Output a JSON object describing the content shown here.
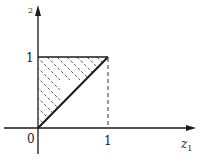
{
  "diagram": {
    "axes": {
      "x_label": "z",
      "x_label_sub": "1",
      "y_label": "2",
      "origin_label": "0",
      "x_tick_label": "1",
      "y_tick_label": "1"
    },
    "region": {
      "description": "Hatched triangle with vertices (0,0), (0,1), (1,1)",
      "vertices": [
        [
          0,
          0
        ],
        [
          0,
          1
        ],
        [
          1,
          1
        ]
      ],
      "fill": "hatched"
    },
    "guide": {
      "description": "Dashed vertical line from (1,1) down to (1,0)"
    },
    "colors": {
      "line": "#1a1a1a",
      "background": "#ffffff"
    }
  }
}
